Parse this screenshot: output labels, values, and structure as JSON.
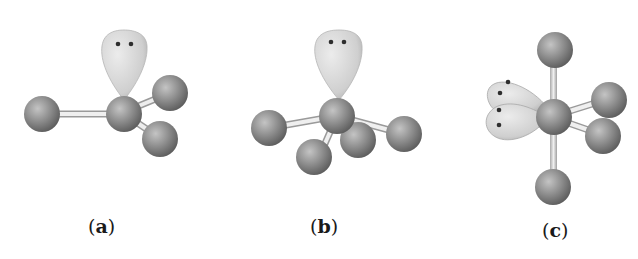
{
  "figure": {
    "panels": [
      {
        "id": "a",
        "label": "(a)",
        "label_letter": "a",
        "lone_pairs": 1,
        "bonded_atoms": 3,
        "geometry": "trigonal pyramidal"
      },
      {
        "id": "b",
        "label": "(b)",
        "label_letter": "b",
        "lone_pairs": 1,
        "bonded_atoms": 4,
        "geometry": "seesaw"
      },
      {
        "id": "c",
        "label": "(c)",
        "label_letter": "c",
        "lone_pairs": 2,
        "bonded_atoms": 4,
        "geometry": "T-shaped / octahedral-derived"
      }
    ],
    "colors": {
      "atom": "#7a7a7a",
      "atom_highlight": "#c8c8c8",
      "lobe": "#d9d9d9",
      "bond": "#e4e4e4",
      "electron_dot": "#333333"
    }
  }
}
